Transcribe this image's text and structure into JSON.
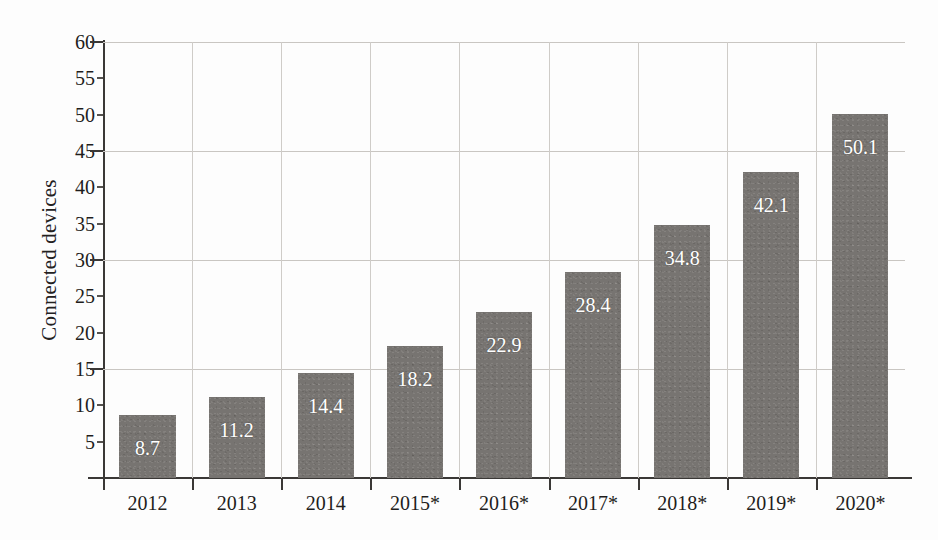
{
  "chart_data": {
    "type": "bar",
    "title": "",
    "xlabel": "",
    "ylabel": "Connected devices",
    "categories": [
      "2012",
      "2013",
      "2014",
      "2015*",
      "2016*",
      "2017*",
      "2018*",
      "2019*",
      "2020*"
    ],
    "values": [
      8.7,
      11.2,
      14.4,
      18.2,
      22.9,
      28.4,
      34.8,
      42.1,
      50.1
    ],
    "value_labels": [
      "8.7",
      "11.2",
      "14.4",
      "18.2",
      "22.9",
      "28.4",
      "34.8",
      "42.1",
      "50.1"
    ],
    "ylim": [
      0,
      60
    ],
    "y_tick_values": [
      5,
      10,
      15,
      20,
      25,
      30,
      35,
      40,
      45,
      50,
      55,
      60
    ],
    "y_tick_labels": [
      "5",
      "10",
      "15",
      "20",
      "25",
      "30",
      "35",
      "40",
      "45",
      "50",
      "55",
      "60"
    ],
    "y_gridline_values": [
      15,
      30,
      45,
      60
    ],
    "grid": "horizontal-and-vertical",
    "legend": "none",
    "bar_color": "#777471",
    "value_label_color": "#ffffff",
    "axis_color": "#3a3836",
    "gridline_color": "#c9c6c2",
    "background_color": "#fdfdfd"
  }
}
